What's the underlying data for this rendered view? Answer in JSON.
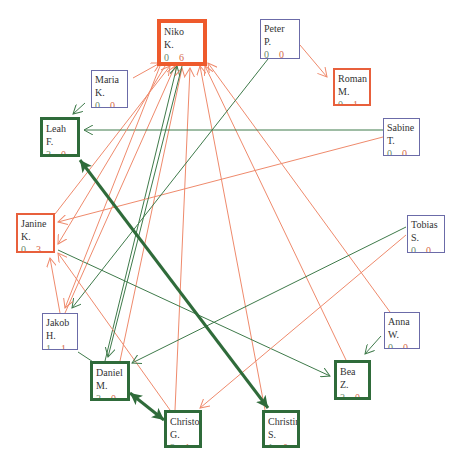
{
  "colors": {
    "green_edge": "#3e7a4a",
    "red_edge": "#ef8a6c",
    "neutral_border": "#6b6ba8",
    "red_border": "#e8603c",
    "green_border": "#2f6b3a"
  },
  "nodes": [
    {
      "id": "niko",
      "first": "Niko",
      "last": "K.",
      "in": "0",
      "out": "6",
      "style": "red strong",
      "x": 157,
      "y": 19,
      "w": 50,
      "h": 47
    },
    {
      "id": "peter",
      "first": "Peter",
      "last": "P.",
      "in": "0",
      "out": "0",
      "style": "neutral",
      "x": 260,
      "y": 19,
      "w": 40,
      "h": 40
    },
    {
      "id": "roman",
      "first": "Roman",
      "last": "M.",
      "in": "0",
      "out": "1",
      "style": "red",
      "x": 333,
      "y": 68,
      "w": 38,
      "h": 38
    },
    {
      "id": "sabine",
      "first": "Sabine",
      "last": "T.",
      "in": "0",
      "out": "0",
      "style": "neutral",
      "x": 383,
      "y": 118,
      "w": 37,
      "h": 38
    },
    {
      "id": "maria",
      "first": "Maria",
      "last": "K.",
      "in": "0",
      "out": "0",
      "style": "neutral",
      "x": 91,
      "y": 70,
      "w": 37,
      "h": 38
    },
    {
      "id": "leah",
      "first": "Leah",
      "last": "F.",
      "in": "3",
      "out": "0",
      "style": "green",
      "x": 40,
      "y": 117,
      "w": 40,
      "h": 40
    },
    {
      "id": "janine",
      "first": "Janine",
      "last": "K.",
      "in": "0",
      "out": "3",
      "style": "red",
      "x": 16,
      "y": 213,
      "w": 39,
      "h": 40
    },
    {
      "id": "tobias",
      "first": "Tobias",
      "last": "S.",
      "in": "0",
      "out": "0",
      "style": "neutral",
      "x": 407,
      "y": 215,
      "w": 38,
      "h": 38
    },
    {
      "id": "jakob",
      "first": "Jakob",
      "last": "H.",
      "in": "1",
      "out": "1",
      "style": "neutral",
      "x": 42,
      "y": 313,
      "w": 36,
      "h": 37
    },
    {
      "id": "anna",
      "first": "Anna",
      "last": "W.",
      "in": "0",
      "out": "0",
      "style": "neutral",
      "x": 384,
      "y": 312,
      "w": 36,
      "h": 37
    },
    {
      "id": "daniel",
      "first": "Daniel",
      "last": "M.",
      "in": "3",
      "out": "0",
      "style": "green",
      "x": 90,
      "y": 361,
      "w": 40,
      "h": 40
    },
    {
      "id": "bea",
      "first": "Bea",
      "last": "Z.",
      "in": "2",
      "out": "0",
      "style": "green",
      "x": 334,
      "y": 360,
      "w": 37,
      "h": 40
    },
    {
      "id": "christop",
      "first": "Christop",
      "last": "G.",
      "in": "2",
      "out": "1",
      "style": "green",
      "x": 164,
      "y": 410,
      "w": 38,
      "h": 38
    },
    {
      "id": "christina",
      "first": "Christina",
      "last": "S.",
      "in": "1",
      "out": "0",
      "style": "green",
      "x": 262,
      "y": 410,
      "w": 38,
      "h": 38
    }
  ],
  "edges": [
    {
      "from": "janine",
      "to": "niko",
      "color": "red",
      "x1": 55,
      "y1": 214,
      "x2": 170,
      "y2": 66
    },
    {
      "from": "jakob",
      "to": "niko",
      "color": "red",
      "x1": 65,
      "y1": 313,
      "x2": 175,
      "y2": 66
    },
    {
      "from": "daniel",
      "to": "niko",
      "color": "green",
      "x1": 105,
      "y1": 361,
      "x2": 177,
      "y2": 66
    },
    {
      "from": "daniel",
      "to": "niko",
      "color": "red",
      "x1": 120,
      "y1": 361,
      "x2": 182,
      "y2": 68
    },
    {
      "from": "christop",
      "to": "niko",
      "color": "red",
      "x1": 175,
      "y1": 410,
      "x2": 190,
      "y2": 68
    },
    {
      "from": "christina",
      "to": "niko",
      "color": "red",
      "x1": 265,
      "y1": 410,
      "x2": 200,
      "y2": 66
    },
    {
      "from": "bea",
      "to": "niko",
      "color": "red",
      "x1": 346,
      "y1": 360,
      "x2": 205,
      "y2": 66
    },
    {
      "from": "anna",
      "to": "niko",
      "color": "red",
      "x1": 390,
      "y1": 312,
      "x2": 208,
      "y2": 63
    },
    {
      "from": "maria",
      "to": "niko",
      "color": "red",
      "x1": 133,
      "y1": 78,
      "x2": 160,
      "y2": 63
    },
    {
      "from": "peter",
      "to": "roman",
      "color": "red",
      "x1": 300,
      "y1": 45,
      "x2": 327,
      "y2": 77
    },
    {
      "from": "maria",
      "to": "leah",
      "color": "green",
      "x1": 85,
      "y1": 103,
      "x2": 73,
      "y2": 114
    },
    {
      "from": "sabine",
      "to": "leah",
      "color": "green",
      "x1": 383,
      "y1": 130,
      "x2": 84,
      "y2": 130
    },
    {
      "from": "sabine",
      "to": "janine",
      "color": "red",
      "x1": 383,
      "y1": 137,
      "x2": 58,
      "y2": 222
    },
    {
      "from": "niko",
      "to": "janine",
      "color": "red",
      "x1": 165,
      "y1": 66,
      "x2": 58,
      "y2": 244
    },
    {
      "from": "jakob",
      "to": "janine",
      "color": "red",
      "x1": 60,
      "y1": 313,
      "x2": 50,
      "y2": 258
    },
    {
      "from": "christop",
      "to": "janine",
      "color": "red",
      "x1": 170,
      "y1": 410,
      "x2": 58,
      "y2": 253
    },
    {
      "from": "janine",
      "to": "bea",
      "color": "green",
      "x1": 58,
      "y1": 250,
      "x2": 330,
      "y2": 376
    },
    {
      "from": "peter",
      "to": "jakob",
      "color": "green",
      "x1": 268,
      "y1": 59,
      "x2": 72,
      "y2": 308
    },
    {
      "from": "niko",
      "to": "jakob",
      "color": "red",
      "x1": 160,
      "y1": 66,
      "x2": 65,
      "y2": 308
    },
    {
      "from": "niko",
      "to": "daniel",
      "color": "green",
      "x1": 182,
      "y1": 66,
      "x2": 108,
      "y2": 357
    },
    {
      "from": "tobias",
      "to": "daniel",
      "color": "green",
      "x1": 406,
      "y1": 227,
      "x2": 132,
      "y2": 363
    },
    {
      "from": "tobias",
      "to": "christop",
      "color": "red",
      "x1": 406,
      "y1": 235,
      "x2": 200,
      "y2": 408
    },
    {
      "from": "anna",
      "to": "bea",
      "color": "green",
      "x1": 381,
      "y1": 336,
      "x2": 365,
      "y2": 354
    },
    {
      "from": "jakob",
      "to": "daniel",
      "color": "green",
      "x1": 78,
      "y1": 352,
      "x2": 113,
      "y2": 375
    }
  ],
  "bold_edges": [
    {
      "from": "leah",
      "to": "christina",
      "x1": 80,
      "y1": 160,
      "x2": 268,
      "y2": 408,
      "bidirectional": true
    },
    {
      "from": "daniel",
      "to": "christop",
      "x1": 130,
      "y1": 393,
      "x2": 164,
      "y2": 420,
      "bidirectional": true
    }
  ]
}
